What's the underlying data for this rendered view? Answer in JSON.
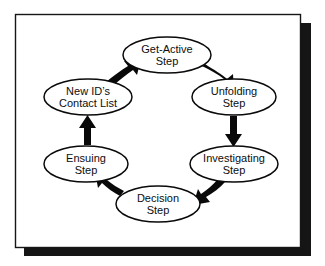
{
  "figure": {
    "name": "cycle-diagram",
    "type": "cycle-flow-diagram",
    "direction": "clockwise",
    "node_count": 6,
    "frame": {
      "border_color": "#161616",
      "fill_color": "#ffffff",
      "shadow_color": "#151515",
      "x": 15,
      "y": 14,
      "width": 285,
      "height": 233,
      "shadow_offset": 9
    },
    "geometry": {
      "center_x": 167,
      "center_y": 142,
      "radius_x": 80,
      "radius_y": 78,
      "ellipse_rx": 43,
      "ellipse_ry": 17
    },
    "nodes": [
      {
        "id": "get-active",
        "line1": "Get-Active",
        "line2": "Step",
        "cx": 167,
        "cy": 55,
        "rx": 44,
        "ry": 18
      },
      {
        "id": "unfolding",
        "line1": "Unfolding",
        "line2": "Step",
        "cx": 234,
        "cy": 97,
        "rx": 42,
        "ry": 18
      },
      {
        "id": "investigating",
        "line1": "Investigating",
        "line2": "Step",
        "cx": 234,
        "cy": 164,
        "rx": 44,
        "ry": 18
      },
      {
        "id": "decision",
        "line1": "Decision",
        "line2": "Step",
        "cx": 158,
        "cy": 204,
        "rx": 42,
        "ry": 18
      },
      {
        "id": "ensuing",
        "line1": "Ensuing",
        "line2": "Step",
        "cx": 86,
        "cy": 164,
        "rx": 42,
        "ry": 18
      },
      {
        "id": "new-id-contact-list",
        "line1": "New ID’s",
        "line2": "Contact List",
        "cx": 88,
        "cy": 97,
        "rx": 44,
        "ry": 18
      }
    ],
    "edges": [
      {
        "id": "edge-get-active-to-unfolding",
        "from": "get-active",
        "to": "unfolding",
        "style": "curved-tapered"
      },
      {
        "id": "edge-unfolding-to-investigating",
        "from": "unfolding",
        "to": "investigating",
        "style": "straight-vertical"
      },
      {
        "id": "edge-investigating-to-decision",
        "from": "investigating",
        "to": "decision",
        "style": "curved-tapered"
      },
      {
        "id": "edge-decision-to-ensuing",
        "from": "decision",
        "to": "ensuing",
        "style": "curved-tapered"
      },
      {
        "id": "edge-ensuing-to-new-id",
        "from": "ensuing",
        "to": "new-id-contact-list",
        "style": "straight-vertical"
      },
      {
        "id": "edge-new-id-to-get-active",
        "from": "new-id-contact-list",
        "to": "get-active",
        "style": "curved-tapered"
      }
    ]
  }
}
